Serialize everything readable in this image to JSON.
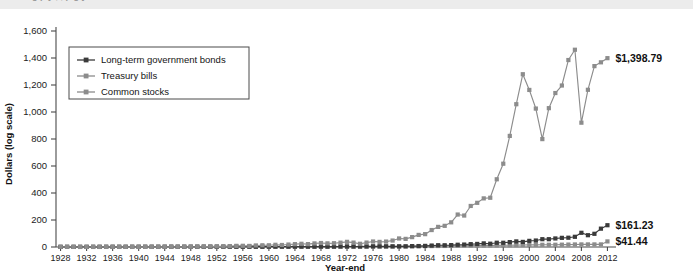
{
  "page": {
    "cut_off_text": "g     p y            ,       ,      p                g   y",
    "card_bg": "#ffffff",
    "outer_bg": "#e8e8e8"
  },
  "chart_data": {
    "type": "line",
    "title": "",
    "xlabel": "Year-end",
    "ylabel": "Dollars (log scale)",
    "ylim": [
      0,
      1600
    ],
    "ytick_labels": [
      "0",
      "200",
      "400",
      "600",
      "800",
      "1,000",
      "1,200",
      "1,400",
      "1,600"
    ],
    "ytick_values": [
      0,
      200,
      400,
      600,
      800,
      1000,
      1200,
      1400,
      1600
    ],
    "xlim": [
      1927,
      2012
    ],
    "xtick_labels": [
      "1928",
      "1932",
      "1936",
      "1940",
      "1944",
      "1948",
      "1952",
      "1956",
      "1960",
      "1964",
      "1968",
      "1972",
      "1976",
      "1980",
      "1984",
      "1988",
      "1992",
      "1996",
      "2000",
      "2004",
      "2008",
      "2012"
    ],
    "grid": false,
    "legend_position": "upper-left-inside",
    "x": [
      1928,
      1929,
      1930,
      1931,
      1932,
      1933,
      1934,
      1935,
      1936,
      1937,
      1938,
      1939,
      1940,
      1941,
      1942,
      1943,
      1944,
      1945,
      1946,
      1947,
      1948,
      1949,
      1950,
      1951,
      1952,
      1953,
      1954,
      1955,
      1956,
      1957,
      1958,
      1959,
      1960,
      1961,
      1962,
      1963,
      1964,
      1965,
      1966,
      1967,
      1968,
      1969,
      1970,
      1971,
      1972,
      1973,
      1974,
      1975,
      1976,
      1977,
      1978,
      1979,
      1980,
      1981,
      1982,
      1983,
      1984,
      1985,
      1986,
      1987,
      1988,
      1989,
      1990,
      1991,
      1992,
      1993,
      1994,
      1995,
      1996,
      1997,
      1998,
      1999,
      2000,
      2001,
      2002,
      2003,
      2004,
      2005,
      2006,
      2007,
      2008,
      2009,
      2010,
      2011,
      2012
    ],
    "series": [
      {
        "name": "Long-term government bonds",
        "color": "#3a3a3a",
        "end_label": "$161.23",
        "end_value": 161.23,
        "values": [
          1.0,
          1.04,
          1.09,
          1.03,
          1.2,
          1.2,
          1.32,
          1.39,
          1.49,
          1.49,
          1.58,
          1.66,
          1.76,
          1.78,
          1.83,
          1.87,
          1.93,
          2.14,
          2.14,
          2.08,
          2.15,
          2.29,
          2.29,
          2.22,
          2.27,
          2.35,
          2.52,
          2.49,
          2.35,
          2.53,
          2.38,
          2.32,
          2.63,
          2.66,
          2.85,
          2.88,
          2.99,
          2.96,
          3.07,
          2.8,
          2.81,
          2.66,
          3.13,
          3.55,
          3.75,
          3.68,
          3.83,
          4.18,
          4.87,
          4.84,
          4.79,
          4.75,
          4.56,
          4.64,
          6.47,
          6.95,
          8.3,
          10.67,
          13.07,
          12.79,
          14.1,
          16.68,
          18.05,
          21.04,
          22.75,
          26.81,
          24.4,
          31.55,
          31.39,
          36.25,
          41.48,
          37.7,
          45.51,
          47.89,
          57.88,
          57.88,
          63.24,
          67.77,
          68.72,
          75.52,
          105.21,
          87.32,
          97.78,
          135.91,
          161.23
        ]
      },
      {
        "name": "Treasury bills",
        "color": "#8c8c8c",
        "end_label": "$41.44",
        "end_value": 41.44,
        "values": [
          1.0,
          1.05,
          1.09,
          1.1,
          1.11,
          1.11,
          1.11,
          1.11,
          1.12,
          1.12,
          1.12,
          1.12,
          1.12,
          1.12,
          1.12,
          1.13,
          1.13,
          1.13,
          1.14,
          1.15,
          1.16,
          1.17,
          1.19,
          1.21,
          1.23,
          1.25,
          1.26,
          1.28,
          1.32,
          1.36,
          1.38,
          1.42,
          1.46,
          1.49,
          1.53,
          1.58,
          1.64,
          1.7,
          1.78,
          1.86,
          1.96,
          2.08,
          2.21,
          2.31,
          2.4,
          2.57,
          2.78,
          2.95,
          3.1,
          3.25,
          3.48,
          3.84,
          4.28,
          4.92,
          5.45,
          5.93,
          6.51,
          6.99,
          7.41,
          7.8,
          8.31,
          8.99,
          9.69,
          10.23,
          10.59,
          10.89,
          11.37,
          11.99,
          12.6,
          13.26,
          13.9,
          14.53,
          15.43,
          16.03,
          16.3,
          16.47,
          16.7,
          17.2,
          18.03,
          18.91,
          19.16,
          19.19,
          19.22,
          19.23,
          41.44
        ]
      },
      {
        "name": "Common stocks",
        "color": "#8c8c8c",
        "end_label": "$1,398.79",
        "end_value": 1398.79,
        "values": [
          1.0,
          0.92,
          0.69,
          0.39,
          0.36,
          0.55,
          0.54,
          0.8,
          1.07,
          0.7,
          0.91,
          0.91,
          0.82,
          0.72,
          0.87,
          1.09,
          1.31,
          1.78,
          1.64,
          1.73,
          1.83,
          2.18,
          2.87,
          3.56,
          4.21,
          4.17,
          6.36,
          8.37,
          8.92,
          7.96,
          11.41,
          12.77,
          12.83,
          16.28,
          14.85,
          18.22,
          21.22,
          23.87,
          21.46,
          26.6,
          29.52,
          27.01,
          28.1,
          32.11,
          38.2,
          32.6,
          23.96,
          32.88,
          40.75,
          37.84,
          40.31,
          47.77,
          63.25,
          60.16,
          73.08,
          89.58,
          95.26,
          125.55,
          148.93,
          156.8,
          182.7,
          240.43,
          233.0,
          304.03,
          327.19,
          360.13,
          364.78,
          501.73,
          616.94,
          822.85,
          1057.79,
          1279.86,
          1163.51,
          1025.45,
          799.18,
          1028.46,
          1140.43,
          1196.24,
          1385.0,
          1461.18,
          920.86,
          1164.51,
          1339.95,
          1368.0,
          1398.79
        ]
      }
    ]
  },
  "legend": {
    "items": [
      {
        "label": "Long-term government bonds",
        "color": "#3a3a3a"
      },
      {
        "label": "Treasury bills",
        "color": "#8c8c8c"
      },
      {
        "label": "Common stocks",
        "color": "#8c8c8c"
      }
    ]
  }
}
